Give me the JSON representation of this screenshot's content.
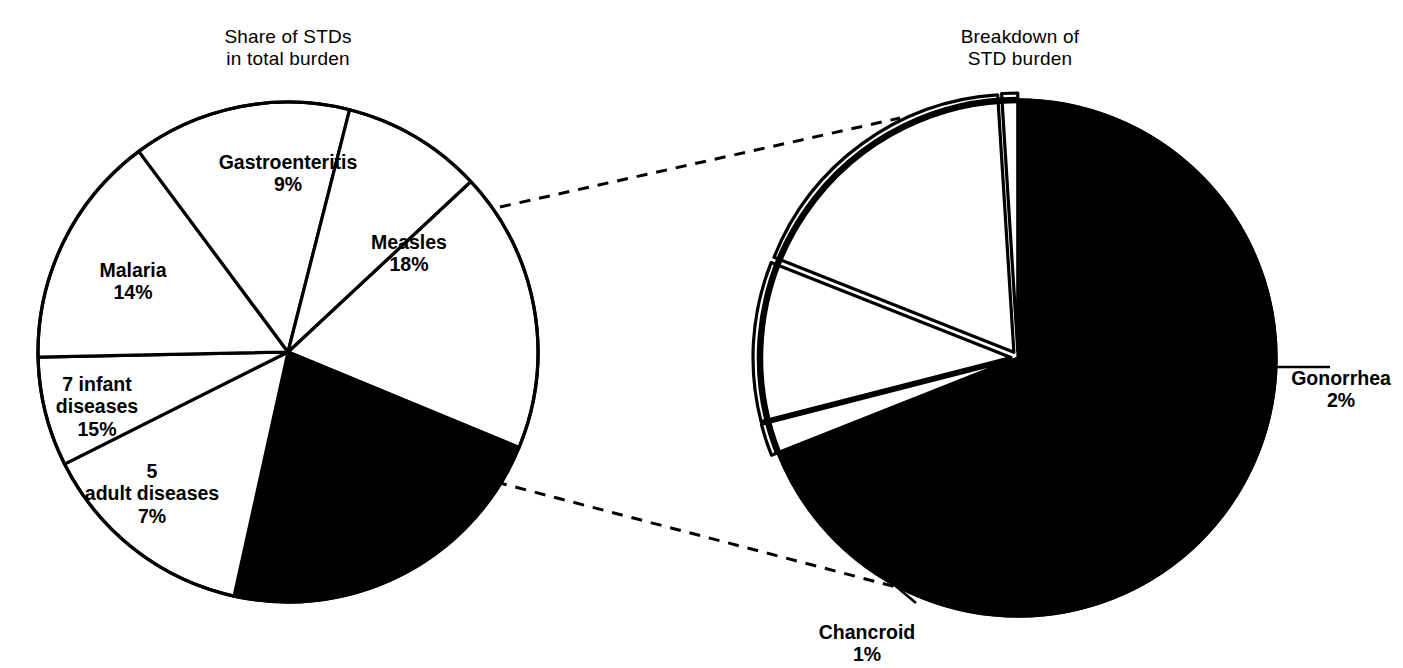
{
  "figure": {
    "background": "#ffffff",
    "ink": "#000000",
    "highlight_fill": "#000000",
    "slice_outline": "#000000"
  },
  "left_chart": {
    "title": "Share of STDs\nin total burden",
    "center": {
      "x": 288,
      "y": 352
    },
    "radius": 250
  },
  "right_chart": {
    "title": "Breakdown of\nSTD burden",
    "center": {
      "x": 1018,
      "y": 358
    },
    "radius": 258
  },
  "labels": {
    "gastroenteritis": {
      "name": "Gastroenteritis",
      "pct": "9%"
    },
    "measles": {
      "name": "Measles",
      "pct": "18%"
    },
    "hiv_stds": {
      "name": "HIV & STDs",
      "pct": "22%"
    },
    "other_diseases": {
      "name": "Other\ndiseases",
      "pct": "14%"
    },
    "adult_diseases": {
      "name": "5\nadult diseases",
      "pct": "7%"
    },
    "infant_diseases": {
      "name": "7 infant\ndiseases",
      "pct": "15%"
    },
    "malaria": {
      "name": "Malaria",
      "pct": "14%"
    },
    "hiv": {
      "name": "HIV",
      "pct": "69%"
    },
    "gonorrhea": {
      "name": "Gonorrhea",
      "pct": "2%"
    },
    "chlamydia": {
      "name": "Chlamydia",
      "pct": "10%"
    },
    "syphilis": {
      "name": "Syphilis",
      "pct": "18%"
    },
    "chancroid": {
      "name": "Chancroid",
      "pct": "1%"
    }
  },
  "chart_data": [
    {
      "type": "pie",
      "id": "share-of-stds-in-total-burden",
      "title": "Share of STDs in total burden",
      "unit": "percent",
      "total": 99,
      "highlighted_slice": "HIV & STDs",
      "legend": "none (labels drawn inside/near slices)",
      "categories": [
        "Measles",
        "HIV & STDs",
        "Other diseases",
        "5 adult diseases",
        "7 infant diseases",
        "Malaria",
        "Gastroenteritis"
      ],
      "values": [
        18,
        22,
        14,
        7,
        15,
        14,
        9
      ],
      "slices": [
        {
          "label": "Measles",
          "value": 18,
          "display": "18%",
          "fill": "white",
          "text_color": "black"
        },
        {
          "label": "HIV & STDs",
          "value": 22,
          "display": "22%",
          "fill": "black",
          "text_color": "white"
        },
        {
          "label": "Other diseases",
          "value": 14,
          "display": "14%",
          "fill": "white",
          "text_color": "black"
        },
        {
          "label": "5 adult diseases",
          "value": 7,
          "display": "7%",
          "fill": "white",
          "text_color": "black"
        },
        {
          "label": "7 infant diseases",
          "value": 15,
          "display": "15%",
          "fill": "white",
          "text_color": "black"
        },
        {
          "label": "Malaria",
          "value": 14,
          "display": "14%",
          "fill": "white",
          "text_color": "black"
        },
        {
          "label": "Gastroenteritis",
          "value": 9,
          "display": "9%",
          "fill": "white",
          "text_color": "black"
        }
      ]
    },
    {
      "type": "pie",
      "id": "breakdown-of-std-burden",
      "title": "Breakdown of STD burden",
      "unit": "percent",
      "total": 100,
      "highlighted_slice": "HIV",
      "legend": "none (labels drawn inside/near slices with leader lines)",
      "categories": [
        "HIV",
        "Gonorrhea",
        "Chlamydia",
        "Syphilis",
        "Chancroid"
      ],
      "values": [
        69,
        2,
        10,
        18,
        1
      ],
      "slices": [
        {
          "label": "HIV",
          "value": 69,
          "display": "69%",
          "fill": "black",
          "text_color": "white"
        },
        {
          "label": "Gonorrhea",
          "value": 2,
          "display": "2%",
          "fill": "white",
          "text_color": "black",
          "leader_line": true
        },
        {
          "label": "Chlamydia",
          "value": 10,
          "display": "10%",
          "fill": "white",
          "text_color": "black"
        },
        {
          "label": "Syphilis",
          "value": 18,
          "display": "18%",
          "fill": "white",
          "text_color": "black"
        },
        {
          "label": "Chancroid",
          "value": 1,
          "display": "1%",
          "fill": "white",
          "text_color": "black",
          "leader_line": true
        }
      ]
    }
  ],
  "connectors": {
    "style": "dashed",
    "description": "two dashed lines linking the HIV & STDs slice of the left pie to the right pie"
  }
}
